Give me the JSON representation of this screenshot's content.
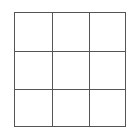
{
  "diagram": {
    "type": "grid",
    "rows": 3,
    "columns": 3,
    "line_color": "#555555",
    "background": "#ffffff",
    "cells": [
      [
        "",
        "",
        ""
      ],
      [
        "",
        "",
        ""
      ],
      [
        "",
        "",
        ""
      ]
    ]
  }
}
